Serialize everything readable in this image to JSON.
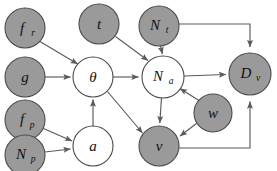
{
  "diagram": {
    "type": "bayesian-network",
    "title": "",
    "canvas": {
      "width": 277,
      "height": 171,
      "background": "#ffffff"
    },
    "style": {
      "shaded_fill": "#9a9a9a",
      "open_fill": "#ffffff",
      "node_stroke": "#4a4a4a",
      "edge_stroke": "#5a5a5a"
    },
    "legend": {
      "shaded_meaning": "observed",
      "open_meaning": "latent"
    },
    "nodes": [
      {
        "id": "f_r",
        "base": "f",
        "sub": "r",
        "shaded": true,
        "cx": 25,
        "cy": 28,
        "r": 20
      },
      {
        "id": "g",
        "base": "g",
        "sub": "",
        "shaded": true,
        "cx": 25,
        "cy": 77,
        "r": 20
      },
      {
        "id": "f_p",
        "base": "f",
        "sub": "p",
        "shaded": true,
        "cx": 25,
        "cy": 120,
        "r": 20
      },
      {
        "id": "N_p",
        "base": "N",
        "sub": "p",
        "shaded": true,
        "cx": 25,
        "cy": 155,
        "r": 20
      },
      {
        "id": "t",
        "base": "t",
        "sub": "",
        "shaded": true,
        "cx": 99,
        "cy": 24,
        "r": 20
      },
      {
        "id": "theta",
        "base": "θ",
        "sub": "",
        "shaded": false,
        "cx": 93,
        "cy": 77,
        "r": 20
      },
      {
        "id": "a",
        "base": "a",
        "sub": "",
        "shaded": false,
        "cx": 93,
        "cy": 146,
        "r": 20
      },
      {
        "id": "N_t",
        "base": "N",
        "sub": "t",
        "shaded": true,
        "cx": 159,
        "cy": 26,
        "r": 20
      },
      {
        "id": "N_a",
        "base": "N",
        "sub": "a",
        "shaded": false,
        "cx": 163,
        "cy": 77,
        "r": 21
      },
      {
        "id": "w",
        "base": "w",
        "sub": "",
        "shaded": true,
        "cx": 213,
        "cy": 113,
        "r": 19
      },
      {
        "id": "v",
        "base": "v",
        "sub": "",
        "shaded": true,
        "cx": 159,
        "cy": 146,
        "r": 20
      },
      {
        "id": "D_v",
        "base": "D",
        "sub": "v",
        "shaded": true,
        "cx": 250,
        "cy": 74,
        "r": 21
      }
    ],
    "edges": [
      {
        "from": "f_r",
        "to": "theta",
        "routing": "direct"
      },
      {
        "from": "g",
        "to": "theta",
        "routing": "direct"
      },
      {
        "from": "a",
        "to": "theta",
        "routing": "direct"
      },
      {
        "from": "f_p",
        "to": "a",
        "routing": "direct"
      },
      {
        "from": "N_p",
        "to": "a",
        "routing": "direct"
      },
      {
        "from": "t",
        "to": "N_a",
        "routing": "direct"
      },
      {
        "from": "N_t",
        "to": "N_a",
        "routing": "direct"
      },
      {
        "from": "theta",
        "to": "N_a",
        "routing": "direct"
      },
      {
        "from": "theta",
        "to": "v",
        "routing": "direct"
      },
      {
        "from": "N_a",
        "to": "v",
        "routing": "direct"
      },
      {
        "from": "w",
        "to": "N_a",
        "routing": "direct"
      },
      {
        "from": "w",
        "to": "v",
        "routing": "direct"
      },
      {
        "from": "N_a",
        "to": "D_v",
        "routing": "direct"
      },
      {
        "from": "N_t",
        "to": "D_v",
        "routing": "orthogonal-right-down"
      },
      {
        "from": "v",
        "to": "D_v",
        "routing": "orthogonal-right-up"
      }
    ]
  }
}
